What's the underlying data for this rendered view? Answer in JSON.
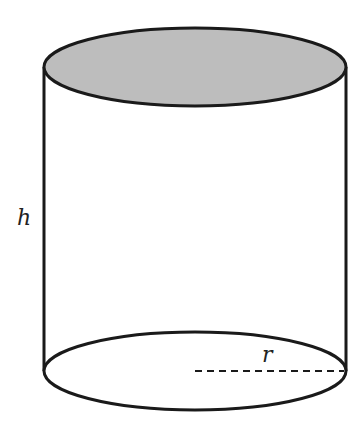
{
  "diagram": {
    "type": "cylinder",
    "labels": {
      "height": "h",
      "radius": "r"
    },
    "colors": {
      "stroke": "#1a1a1a",
      "top_fill": "#bdbdbd",
      "bottom_fill": "#ffffff",
      "background": "#ffffff"
    },
    "geometry": {
      "cx": 195,
      "rx": 151,
      "ry": 39,
      "top_cy": 67,
      "bottom_cy": 371
    }
  }
}
